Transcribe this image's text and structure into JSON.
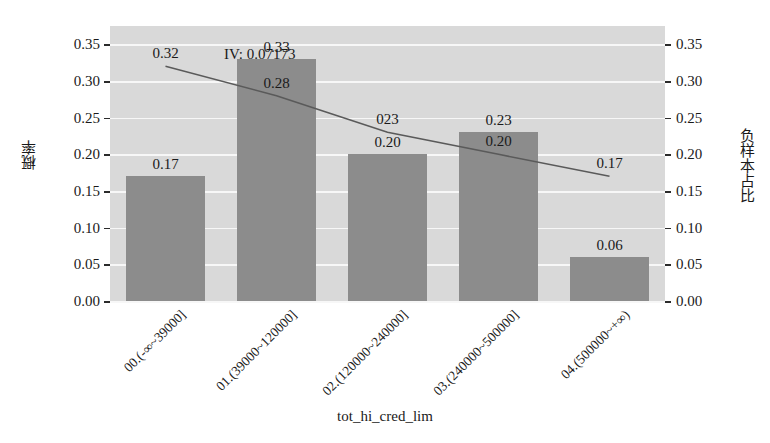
{
  "chart_data": {
    "type": "bar",
    "title": "",
    "xlabel": "tot_hi_cred_lim",
    "ylabel": "概率",
    "ylabel_right": "负样本占比",
    "annotation": "IV: 0.07173",
    "categories": [
      "00.(-∞~39000]",
      "01.(39000~120000]",
      "02.(120000~240000]",
      "03.(240000~500000]",
      "04.(500000~+∞)"
    ],
    "series": [
      {
        "name": "概率",
        "kind": "bar",
        "axis": "left",
        "values": [
          0.17,
          0.33,
          0.2,
          0.23,
          0.06
        ],
        "labels": [
          "0.17",
          "0.33",
          "0.20",
          "0.23",
          "0.06"
        ],
        "color": "#8c8c8c"
      },
      {
        "name": "负样本占比",
        "kind": "line",
        "axis": "right",
        "values": [
          0.32,
          0.28,
          0.23,
          0.2,
          0.17
        ],
        "labels": [
          "0.32",
          "0.28",
          "023",
          "0.20",
          "0.17"
        ],
        "color": "#5a5a5a"
      }
    ],
    "ylim": [
      0.0,
      0.375
    ],
    "yticks": [
      0.0,
      0.05,
      0.1,
      0.15,
      0.2,
      0.25,
      0.3,
      0.35
    ],
    "ytick_labels": [
      "0.00",
      "0.05",
      "0.10",
      "0.15",
      "0.20",
      "0.25",
      "0.30",
      "0.35"
    ],
    "ylim_right": [
      0.0,
      0.375
    ],
    "yticks_right": [
      0.0,
      0.05,
      0.1,
      0.15,
      0.2,
      0.25,
      0.3,
      0.35
    ],
    "ytick_labels_right": [
      "0.00",
      "0.05",
      "0.10",
      "0.15",
      "0.20",
      "0.25",
      "0.30",
      "0.35"
    ],
    "grid": true,
    "grid_color": "#f7f7f7",
    "plot_background": "#d9d9d9",
    "figure_background": "#ffffff",
    "legend": null
  }
}
